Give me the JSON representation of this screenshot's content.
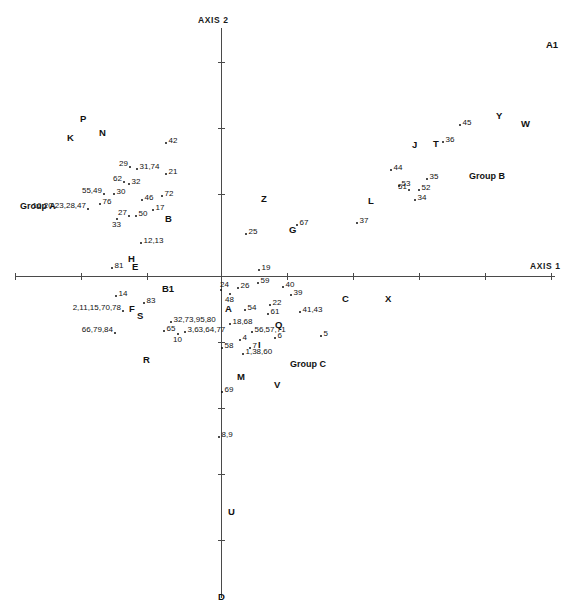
{
  "chart_data": {
    "type": "scatter",
    "title": "",
    "xlabel": "AXIS 1",
    "ylabel": "AXIS 2",
    "grid": false,
    "legend": "none",
    "axes": {
      "x_axis_label": "AXIS 1",
      "y_axis_label": "AXIS 2",
      "origin_px": [
        221,
        276
      ],
      "x_tick_spacing_px": 66,
      "y_tick_spacing_px": 66,
      "x_ticks_px": [
        15,
        81,
        147,
        221,
        348,
        414,
        480
      ],
      "y_ticks_px": [
        62,
        128,
        194,
        276,
        342,
        408,
        474,
        540
      ]
    },
    "points": [
      {
        "label": "42",
        "x": 166,
        "y": 143
      },
      {
        "label": "29",
        "x": 130,
        "y": 167
      },
      {
        "label": "31,74",
        "x": 137,
        "y": 169
      },
      {
        "label": "21",
        "x": 166,
        "y": 174
      },
      {
        "label": "62",
        "x": 124,
        "y": 182
      },
      {
        "label": "32",
        "x": 129,
        "y": 184
      },
      {
        "label": "55,49",
        "x": 104,
        "y": 194
      },
      {
        "label": "30",
        "x": 114,
        "y": 194
      },
      {
        "label": "72",
        "x": 162,
        "y": 196
      },
      {
        "label": "76",
        "x": 100,
        "y": 204
      },
      {
        "label": "46",
        "x": 142,
        "y": 200
      },
      {
        "label": "16,20,23,28,47",
        "x": 88,
        "y": 209
      },
      {
        "label": "17",
        "x": 153,
        "y": 210
      },
      {
        "label": "27",
        "x": 129,
        "y": 216
      },
      {
        "label": "50",
        "x": 136,
        "y": 216
      },
      {
        "label": "33",
        "x": 117,
        "y": 219
      },
      {
        "label": "12,13",
        "x": 141,
        "y": 243
      },
      {
        "label": "81",
        "x": 112,
        "y": 268
      },
      {
        "label": "25",
        "x": 246,
        "y": 234
      },
      {
        "label": "67",
        "x": 297,
        "y": 225
      },
      {
        "label": "37",
        "x": 357,
        "y": 223
      },
      {
        "label": "44",
        "x": 391,
        "y": 170
      },
      {
        "label": "53",
        "x": 399,
        "y": 186
      },
      {
        "label": "35",
        "x": 427,
        "y": 179
      },
      {
        "label": "51",
        "x": 409,
        "y": 190
      },
      {
        "label": "52",
        "x": 419,
        "y": 190
      },
      {
        "label": "34",
        "x": 415,
        "y": 200
      },
      {
        "label": "45",
        "x": 460,
        "y": 125
      },
      {
        "label": "36",
        "x": 443,
        "y": 142
      },
      {
        "label": "19",
        "x": 259,
        "y": 270
      },
      {
        "label": "24",
        "x": 221,
        "y": 290
      },
      {
        "label": "26",
        "x": 238,
        "y": 288
      },
      {
        "label": "48",
        "x": 230,
        "y": 294
      },
      {
        "label": "59",
        "x": 258,
        "y": 283
      },
      {
        "label": "40",
        "x": 283,
        "y": 287
      },
      {
        "label": "39",
        "x": 291,
        "y": 295
      },
      {
        "label": "14",
        "x": 116,
        "y": 296
      },
      {
        "label": "83",
        "x": 144,
        "y": 303
      },
      {
        "label": "22",
        "x": 270,
        "y": 305
      },
      {
        "label": "2,11,15,70,78",
        "x": 123,
        "y": 311
      },
      {
        "label": "61",
        "x": 268,
        "y": 314
      },
      {
        "label": "41,43",
        "x": 300,
        "y": 312
      },
      {
        "label": "54",
        "x": 245,
        "y": 310
      },
      {
        "label": "32,73,95,80",
        "x": 171,
        "y": 322
      },
      {
        "label": "18,68",
        "x": 230,
        "y": 324
      },
      {
        "label": "66,79,84",
        "x": 115,
        "y": 333
      },
      {
        "label": "65",
        "x": 164,
        "y": 331
      },
      {
        "label": "3,63,64,77",
        "x": 185,
        "y": 332
      },
      {
        "label": "10",
        "x": 178,
        "y": 334
      },
      {
        "label": "56,57,71",
        "x": 252,
        "y": 332
      },
      {
        "label": "6",
        "x": 275,
        "y": 338
      },
      {
        "label": "5",
        "x": 321,
        "y": 336
      },
      {
        "label": "4",
        "x": 240,
        "y": 340
      },
      {
        "label": "58",
        "x": 222,
        "y": 348
      },
      {
        "label": "7",
        "x": 250,
        "y": 348
      },
      {
        "label": "1,38,60",
        "x": 243,
        "y": 354
      },
      {
        "label": "69",
        "x": 222,
        "y": 392
      },
      {
        "label": "8,9",
        "x": 219,
        "y": 437
      }
    ],
    "group_letters": [
      {
        "label": "A1",
        "x": 546,
        "y": 40
      },
      {
        "label": "P",
        "x": 80,
        "y": 114
      },
      {
        "label": "K",
        "x": 67,
        "y": 133
      },
      {
        "label": "N",
        "x": 99,
        "y": 128
      },
      {
        "label": "Y",
        "x": 496,
        "y": 111
      },
      {
        "label": "W",
        "x": 521,
        "y": 119
      },
      {
        "label": "J",
        "x": 412,
        "y": 140
      },
      {
        "label": "T",
        "x": 433,
        "y": 139
      },
      {
        "label": "Z",
        "x": 261,
        "y": 194
      },
      {
        "label": "L",
        "x": 368,
        "y": 196
      },
      {
        "label": "B",
        "x": 165,
        "y": 214
      },
      {
        "label": "G",
        "x": 289,
        "y": 225
      },
      {
        "label": "H",
        "x": 128,
        "y": 254
      },
      {
        "label": "E",
        "x": 132,
        "y": 262
      },
      {
        "label": "B1",
        "x": 162,
        "y": 284
      },
      {
        "label": "C",
        "x": 342,
        "y": 294
      },
      {
        "label": "X",
        "x": 385,
        "y": 294
      },
      {
        "label": "A",
        "x": 225,
        "y": 304
      },
      {
        "label": "F",
        "x": 129,
        "y": 304
      },
      {
        "label": "S",
        "x": 137,
        "y": 311
      },
      {
        "label": "Q",
        "x": 275,
        "y": 320
      },
      {
        "label": "I",
        "x": 258,
        "y": 340
      },
      {
        "label": "R",
        "x": 143,
        "y": 355
      },
      {
        "label": "M",
        "x": 237,
        "y": 372
      },
      {
        "label": "V",
        "x": 274,
        "y": 380
      },
      {
        "label": "U",
        "x": 228,
        "y": 507
      },
      {
        "label": "D",
        "x": 218,
        "y": 592
      }
    ],
    "group_names": [
      {
        "label": "Group A",
        "x": 20,
        "y": 202
      },
      {
        "label": "Group B",
        "x": 469,
        "y": 172
      },
      {
        "label": "Group C",
        "x": 290,
        "y": 360
      }
    ]
  }
}
